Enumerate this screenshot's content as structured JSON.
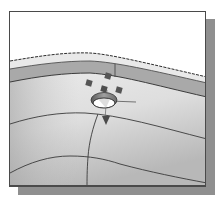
{
  "figure": {
    "kind": "3D CAD model viewport with hole feature and drag handles",
    "colors": {
      "background": "#ffffff",
      "frame_border": "#4a4a4a",
      "frame_shadow": "#8f8f8f",
      "surface_light": "#ececec",
      "surface_dark": "#b4b4b4",
      "edge_band": "#a9a9a9",
      "edge_line": "#3c3c3c",
      "handle": "#555555",
      "hole_fill": "#ffffff"
    },
    "elements": {
      "silhouette_edge": "dashed top silhouette curve",
      "edge_band": "grey fillet band across upper surface",
      "hole": "circular hole with shaded rim",
      "handles": [
        "handle-top",
        "handle-left",
        "handle-center",
        "handle-right"
      ],
      "direction_arrow": "down-pointing depth arrow",
      "isolines": [
        "upper-isoline",
        "lower-isoline",
        "vertical-isoline"
      ]
    }
  }
}
